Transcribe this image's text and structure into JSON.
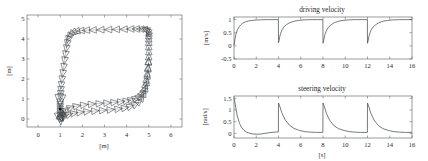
{
  "figure": {
    "background": "#ffffff",
    "line_color": "#4a4f53",
    "marker_color": "#3c4145"
  },
  "chart_data": [
    {
      "id": "trajectory",
      "type": "line",
      "title": "",
      "xlabel": "[m]",
      "ylabel": "[m]",
      "xlim": [
        -0.5,
        6.5
      ],
      "ylim": [
        -0.4,
        5.2
      ],
      "xticks": [
        0,
        1,
        2,
        3,
        4,
        5,
        6
      ],
      "xticklabels": [
        "0",
        "1",
        "2",
        "3",
        "4",
        "5",
        "6"
      ],
      "yticks": [
        0,
        1,
        2,
        3,
        4,
        5
      ],
      "yticklabels": [
        "0",
        "1",
        "2",
        "3",
        "4",
        "5"
      ],
      "grid": false,
      "legend": "none",
      "description": "Closed-loop mobile robot trajectory tracking a rectangular reference path, with triangular pose markers drawn at uniform time samples.",
      "start_point": [
        1.0,
        0.5
      ],
      "series": [
        {
          "name": "robot path",
          "x": [
            1.02,
            1.05,
            1.12,
            1.25,
            1.45,
            1.72,
            2.05,
            2.4,
            2.75,
            3.1,
            3.42,
            3.72,
            3.98,
            4.2,
            4.4,
            4.56,
            4.68,
            4.78,
            4.85,
            4.9,
            4.94,
            4.97,
            4.99,
            5.0,
            5.0,
            5.0,
            5.0,
            5.0,
            5.0,
            5.0,
            4.99,
            4.96,
            4.9,
            4.8,
            4.65,
            4.45,
            4.2,
            3.9,
            3.55,
            3.2,
            2.85,
            2.5,
            2.2,
            1.95,
            1.75,
            1.6,
            1.5,
            1.42,
            1.36,
            1.32,
            1.28,
            1.24,
            1.2,
            1.16,
            1.12,
            1.08,
            1.05,
            1.03,
            1.02,
            1.01,
            1.0,
            1.0,
            1.0,
            1.0,
            1.0,
            1.0,
            1.0,
            1.0,
            1.0,
            1.01,
            1.04,
            1.1,
            1.2,
            1.38,
            1.6,
            1.88,
            2.2,
            2.55,
            2.9,
            3.25,
            3.6,
            3.9,
            4.15,
            4.38,
            4.55,
            4.68,
            4.78,
            4.85,
            4.9,
            4.94,
            4.97,
            4.99
          ],
          "y": [
            0.12,
            0.2,
            0.32,
            0.45,
            0.56,
            0.64,
            0.7,
            0.74,
            0.77,
            0.8,
            0.83,
            0.86,
            0.9,
            0.95,
            1.02,
            1.12,
            1.26,
            1.45,
            1.68,
            1.95,
            2.25,
            2.55,
            2.85,
            3.1,
            3.35,
            3.6,
            3.82,
            4.0,
            4.15,
            4.28,
            4.36,
            4.42,
            4.46,
            4.49,
            4.5,
            4.5,
            4.5,
            4.49,
            4.48,
            4.47,
            4.46,
            4.45,
            4.44,
            4.42,
            4.39,
            4.34,
            4.26,
            4.15,
            4.0,
            3.8,
            3.55,
            3.25,
            2.95,
            2.62,
            2.3,
            2.0,
            1.72,
            1.48,
            1.28,
            1.12,
            0.98,
            0.86,
            0.74,
            0.62,
            0.5,
            0.38,
            0.26,
            0.16,
            0.08,
            0.04,
            0.04,
            0.08,
            0.15,
            0.22,
            0.28,
            0.33,
            0.37,
            0.4,
            0.43,
            0.46,
            0.5,
            0.55,
            0.62,
            0.72,
            0.86,
            1.04,
            1.26,
            1.52,
            1.82,
            2.15,
            2.5,
            2.85
          ]
        }
      ]
    },
    {
      "id": "driving-velocity",
      "type": "line",
      "title": "driving velocity",
      "xlabel": "",
      "ylabel": "[m/s]",
      "xlim": [
        0,
        16
      ],
      "ylim": [
        -0.5,
        1.1
      ],
      "xticks": [
        0,
        2,
        4,
        6,
        8,
        10,
        12,
        14,
        16
      ],
      "xticklabels": [
        "0",
        "2",
        "4",
        "6",
        "8",
        "10",
        "12",
        "14",
        "16"
      ],
      "yticks": [
        -0.5,
        0,
        0.5,
        1
      ],
      "yticklabels": [
        "-0.5",
        "0",
        "0.5",
        "1"
      ],
      "grid": false,
      "legend": "none",
      "description": "Driving (linear) velocity command: exponential rise to about 1 m/s, dropping back near 0.1 m/s at each 4 s waypoint switch.",
      "period": 4,
      "peak_value": 1.0,
      "reset_value": 0.1,
      "series": [
        {
          "name": "v",
          "x": [
            0,
            0.1,
            0.2,
            0.3,
            0.45,
            0.6,
            0.8,
            1.0,
            1.3,
            1.6,
            2.0,
            2.5,
            3.0,
            3.5,
            3.99,
            4.0,
            4.05,
            4.15,
            4.3,
            4.5,
            4.75,
            5.0,
            5.4,
            5.8,
            6.3,
            6.9,
            7.5,
            7.99,
            8.0,
            8.05,
            8.15,
            8.3,
            8.5,
            8.75,
            9.0,
            9.4,
            9.8,
            10.3,
            10.9,
            11.5,
            11.99,
            12.0,
            12.05,
            12.15,
            12.3,
            12.5,
            12.75,
            13.0,
            13.4,
            13.8,
            14.3,
            14.9,
            15.5,
            16.0
          ],
          "y": [
            0.02,
            0.3,
            0.48,
            0.6,
            0.72,
            0.8,
            0.87,
            0.91,
            0.95,
            0.97,
            0.985,
            0.995,
            1.0,
            1.0,
            1.0,
            0.12,
            0.2,
            0.42,
            0.6,
            0.73,
            0.82,
            0.88,
            0.94,
            0.97,
            0.99,
            1.0,
            1.0,
            1.0,
            0.1,
            0.18,
            0.4,
            0.58,
            0.72,
            0.81,
            0.88,
            0.94,
            0.97,
            0.99,
            1.0,
            1.0,
            1.0,
            0.1,
            0.18,
            0.4,
            0.58,
            0.72,
            0.81,
            0.88,
            0.94,
            0.97,
            0.99,
            1.0,
            1.0,
            1.0
          ]
        }
      ]
    },
    {
      "id": "steering-velocity",
      "type": "line",
      "title": "steering velocity",
      "xlabel": "[s]",
      "ylabel": "[rad/s]",
      "xlim": [
        0,
        16
      ],
      "ylim": [
        -0.2,
        1.6
      ],
      "xticks": [
        0,
        2,
        4,
        6,
        8,
        10,
        12,
        14,
        16
      ],
      "xticklabels": [
        "0",
        "2",
        "4",
        "6",
        "8",
        "10",
        "12",
        "14",
        "16"
      ],
      "yticks": [
        0,
        0.5,
        1,
        1.5
      ],
      "yticklabels": [
        "0",
        "0.5",
        "1",
        "1.5"
      ],
      "grid": false,
      "legend": "none",
      "description": "Steering (angular) velocity command: initial peak near 1.5 rad/s decaying toward zero, then a spike of about 1.3 rad/s at every 4 s corner.",
      "period": 4,
      "initial_peak": 1.5,
      "corner_peak": 1.3,
      "series": [
        {
          "name": "omega",
          "x": [
            0,
            0.05,
            0.15,
            0.3,
            0.5,
            0.7,
            0.9,
            1.1,
            1.3,
            1.6,
            2.0,
            2.4,
            2.8,
            3.2,
            3.6,
            3.99,
            4.0,
            4.1,
            4.3,
            4.6,
            5.0,
            5.4,
            5.9,
            6.4,
            6.9,
            7.4,
            7.99,
            8.0,
            8.1,
            8.3,
            8.6,
            9.0,
            9.4,
            9.9,
            10.4,
            10.9,
            11.4,
            11.99,
            12.0,
            12.1,
            12.3,
            12.6,
            13.0,
            13.4,
            13.9,
            14.4,
            14.9,
            15.4,
            16.0
          ],
          "y": [
            1.5,
            1.42,
            1.12,
            0.74,
            0.42,
            0.24,
            0.13,
            0.06,
            0.02,
            -0.02,
            -0.04,
            -0.03,
            0.0,
            0.03,
            0.05,
            0.06,
            1.3,
            1.18,
            0.88,
            0.58,
            0.34,
            0.21,
            0.12,
            0.07,
            0.05,
            0.04,
            0.04,
            1.3,
            1.18,
            0.86,
            0.56,
            0.32,
            0.2,
            0.12,
            0.07,
            0.05,
            0.04,
            0.04,
            1.3,
            1.18,
            0.86,
            0.56,
            0.32,
            0.2,
            0.12,
            0.07,
            0.05,
            0.04,
            0.04
          ]
        }
      ]
    }
  ]
}
